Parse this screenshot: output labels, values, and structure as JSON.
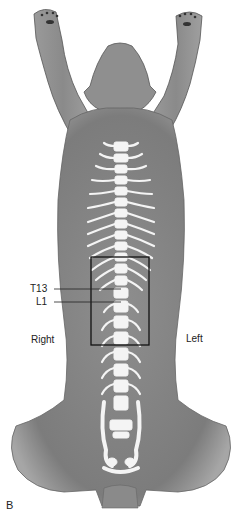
{
  "figure": {
    "panel_label": "B",
    "labels": {
      "t13": "T13",
      "l1": "L1",
      "right": "Right",
      "left": "Left"
    },
    "highlight_box": {
      "x": 91,
      "y": 257,
      "width": 58,
      "height": 88
    },
    "colors": {
      "body": "#8a8a8a",
      "body_dark": "#6e6e6e",
      "bone": "#f4f4f4",
      "outline": "#222222",
      "background": "#ffffff"
    }
  }
}
